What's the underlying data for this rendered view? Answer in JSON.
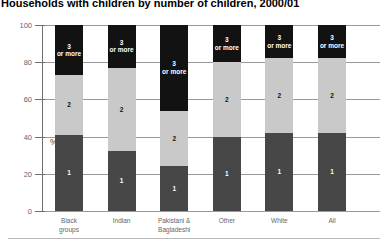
{
  "chart_data": {
    "type": "bar",
    "stacked": true,
    "title": "Households with children by number of children, 2000/01",
    "ylabel": "%",
    "xlabel": "",
    "ylim": [
      0,
      100
    ],
    "yticks": [
      0,
      20,
      40,
      60,
      80,
      100
    ],
    "grid": true,
    "legend": "none",
    "categories": [
      "Black\ngroups",
      "Indian",
      "Pakistani &\nBagladeshi",
      "Other",
      "White",
      "All"
    ],
    "series": [
      {
        "name": "1",
        "label": "1",
        "color": "#474747",
        "label_color": "#ffffff",
        "values": [
          41,
          32,
          24,
          40,
          42,
          42
        ]
      },
      {
        "name": "2",
        "label": "2",
        "color": "#c9c9c9",
        "label_color": "#111111",
        "values": [
          32,
          45,
          30,
          40,
          40,
          40
        ]
      },
      {
        "name": "3 or more",
        "label": "3\nor more",
        "color": "#121212",
        "label_color": "#ffffff",
        "values": [
          27,
          23,
          46,
          20,
          18,
          18
        ]
      }
    ],
    "colors": {
      "gridline": "#999999",
      "axis": "#6e6e6e",
      "tick_label": "#666666",
      "bottom_rule": "#b8b8b8",
      "background": "#ffffff"
    }
  }
}
